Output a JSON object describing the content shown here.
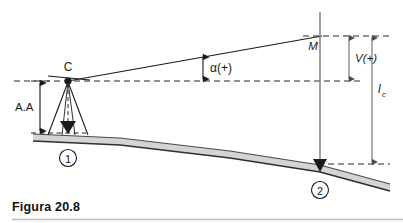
{
  "figure": {
    "caption": "Figura 20.8",
    "labels": {
      "instrument_point": "C",
      "instrument_height": "A.A",
      "vertical_angle": "α(+)",
      "target_point": "M",
      "vertical_distance": "V(+)",
      "rod_reading": "l",
      "rod_reading_sub": "c",
      "station_1": "1",
      "station_2": "2"
    },
    "colors": {
      "line": "#1b1b1b",
      "ground_fill": "#d6d4d0",
      "ground_stroke": "#3a3a3a",
      "dimension": "#6b6b6b",
      "dashed": "#2b2b2b",
      "caption": "#111111",
      "rule": "#bdbdbd",
      "background": "#ffffff"
    },
    "geometry": {
      "point_C": [
        68,
        81
      ],
      "point_M": [
        320,
        36
      ],
      "station_2_ground": [
        320,
        165
      ],
      "sight_line_angle_label_x": 203,
      "horizon_y": 81,
      "target_level_y": 36,
      "ground_level_y": 165
    }
  }
}
